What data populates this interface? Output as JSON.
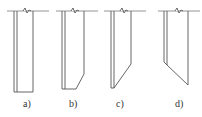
{
  "diagram": {
    "colors": {
      "stroke": "#555555",
      "ground": "#888888"
    },
    "figures": [
      {
        "id": "a",
        "label": "a)",
        "shape": "flat-bottom"
      },
      {
        "id": "b",
        "label": "b)",
        "shape": "chamfered-bottom"
      },
      {
        "id": "c",
        "label": "c)",
        "shape": "single-bevel-bottom"
      },
      {
        "id": "d",
        "label": "d)",
        "shape": "long-bevel-bottom"
      }
    ]
  }
}
